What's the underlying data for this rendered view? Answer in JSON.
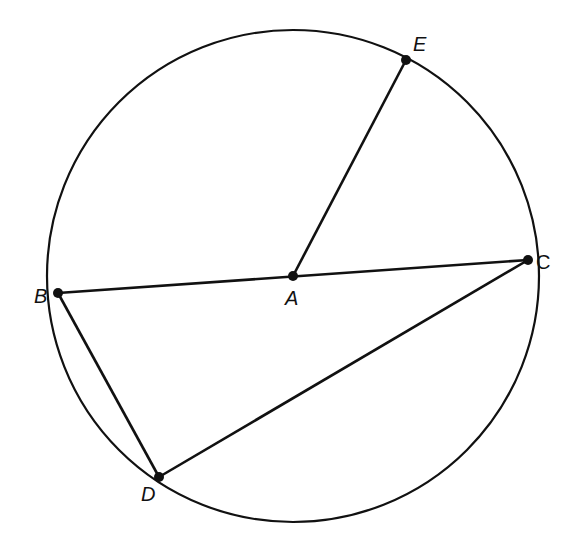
{
  "diagram": {
    "type": "circle-geometry",
    "stroke_color": "#111111",
    "background": "#ffffff",
    "circle": {
      "center": "A",
      "cx": 293,
      "cy": 276,
      "r": 246
    },
    "points": [
      {
        "id": "A",
        "label": "A",
        "x": 293,
        "y": 276,
        "label_x": 285,
        "label_y": 288
      },
      {
        "id": "B",
        "label": "B",
        "x": 58,
        "y": 293,
        "label_x": 34,
        "label_y": 286
      },
      {
        "id": "C",
        "label": "C",
        "x": 528,
        "y": 260,
        "label_x": 536,
        "label_y": 252
      },
      {
        "id": "D",
        "label": "D",
        "x": 159,
        "y": 477,
        "label_x": 141,
        "label_y": 484
      },
      {
        "id": "E",
        "label": "E",
        "x": 406,
        "y": 60,
        "label_x": 413,
        "label_y": 34
      }
    ],
    "segments": [
      {
        "name": "BC",
        "from": "B",
        "to": "C",
        "note": "diameter through A"
      },
      {
        "name": "AE",
        "from": "A",
        "to": "E",
        "note": "radius"
      },
      {
        "name": "BD",
        "from": "B",
        "to": "D",
        "note": "chord"
      },
      {
        "name": "DC",
        "from": "D",
        "to": "C",
        "note": "chord"
      }
    ]
  }
}
